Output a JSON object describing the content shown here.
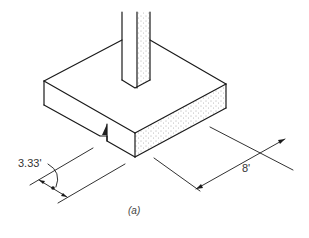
{
  "figure": {
    "caption": "(a)",
    "dimensions": {
      "distance_label": "3.33'",
      "width_label": "8'"
    }
  }
}
